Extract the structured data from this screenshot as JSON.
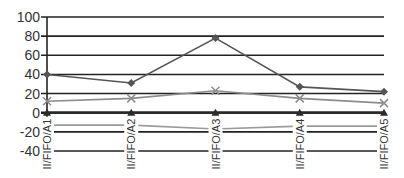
{
  "chart_data": {
    "type": "line",
    "title": "",
    "xlabel": "",
    "ylabel": "",
    "categories": [
      "II/FIFO/A1",
      "II/FIFO/A2",
      "II/FIFO/A3",
      "II/FIFO/A4",
      "II/FIFO/A5"
    ],
    "ylim": [
      -40,
      100
    ],
    "yticks": [
      100,
      80,
      60,
      40,
      20,
      0,
      -20,
      -40
    ],
    "grid": true,
    "legend": "none",
    "series": [
      {
        "name": "Series 1",
        "marker": "diamond",
        "color": "#555555",
        "values": [
          40,
          31,
          78,
          27,
          22
        ]
      },
      {
        "name": "Series 2",
        "marker": "x",
        "color": "#8c8c8c",
        "values": [
          12,
          15,
          23,
          15,
          10
        ]
      },
      {
        "name": "Series 3",
        "marker": "triangle",
        "color": "#2b2b2b",
        "values": [
          0,
          0,
          0,
          0,
          0
        ]
      },
      {
        "name": "Series 4",
        "marker": "none",
        "color": "#9a9a9a",
        "values": [
          -13,
          -13,
          -17,
          -14,
          -14
        ]
      }
    ]
  },
  "colors": {
    "gridline": "#222222",
    "axis": "#222222",
    "background": "#ffffff"
  }
}
